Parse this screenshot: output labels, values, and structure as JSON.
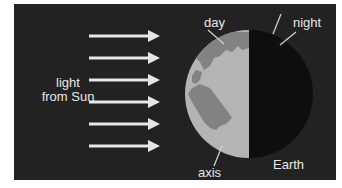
{
  "diagram": {
    "labels": {
      "light_line1": "light",
      "light_line2": "from Sun",
      "day": "day",
      "night": "night",
      "axis": "axis",
      "earth": "Earth"
    },
    "arrows": {
      "count": 6,
      "direction": "right",
      "y_positions": [
        36,
        58,
        80,
        102,
        124,
        146
      ]
    },
    "earth": {
      "lit_side": "left",
      "dark_side": "right"
    },
    "colors": {
      "background": "#222222",
      "arrow": "#e6e6e6",
      "ocean_lit": "#b4b4b4",
      "land_lit": "#828282",
      "night_side": "#0e0e0e",
      "text": "#e6e6e6"
    }
  }
}
